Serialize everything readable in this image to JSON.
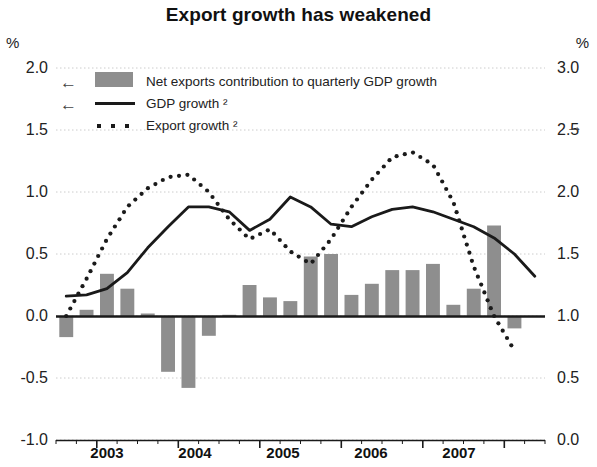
{
  "title": "Export growth has weakened",
  "axis": {
    "left_unit": "%",
    "right_unit": "%",
    "left_ticks": [
      "2.0",
      "1.5",
      "1.0",
      "0.5",
      "0.0",
      "-0.5",
      "-1.0"
    ],
    "right_ticks": [
      "3.0",
      "2.5",
      "2.0",
      "1.5",
      "1.0",
      "0.5",
      "0.0"
    ],
    "x_ticks": [
      "2003",
      "2004",
      "2005",
      "2006",
      "2007"
    ]
  },
  "legend": {
    "bars": "Net exports contribution to quarterly GDP growth",
    "gdp": "GDP growth ²",
    "exports": "Export growth ²",
    "arrow_left": "←",
    "arrow_right": "→"
  },
  "colors": {
    "bar": "#8e8e8e",
    "line": "#1a1a1a",
    "grid": "#cccccc",
    "axis": "#1a1a1a",
    "text": "#1a1a1a"
  },
  "chart_data": {
    "type": "bar",
    "title": "Export growth has weakened",
    "xlabel": "",
    "ylabel": "%",
    "ylim": [
      -1.0,
      2.0
    ],
    "y2lim": [
      0.0,
      3.0
    ],
    "grid": true,
    "legend_position": "top-left",
    "categories": [
      "2002 Q3",
      "2002 Q4",
      "2003 Q1",
      "2003 Q2",
      "2003 Q3",
      "2003 Q4",
      "2004 Q1",
      "2004 Q2",
      "2004 Q3",
      "2004 Q4",
      "2005 Q1",
      "2005 Q2",
      "2005 Q3",
      "2005 Q4",
      "2006 Q1",
      "2006 Q2",
      "2006 Q3",
      "2006 Q4",
      "2007 Q1",
      "2007 Q2",
      "2007 Q3",
      "2007 Q4",
      "2008 Q1",
      "2008 Q2"
    ],
    "series": [
      {
        "name": "Net exports contribution to quarterly GDP growth",
        "type": "bar",
        "axis": "left",
        "values": [
          -0.17,
          0.05,
          0.34,
          0.22,
          0.02,
          -0.45,
          -0.58,
          -0.16,
          0.01,
          0.25,
          0.15,
          0.12,
          0.48,
          0.5,
          0.17,
          0.26,
          0.37,
          0.37,
          0.42,
          0.09,
          0.22,
          0.73,
          -0.1,
          null
        ]
      },
      {
        "name": "GDP growth ²",
        "type": "line",
        "axis": "left",
        "values": [
          0.16,
          0.17,
          0.22,
          0.35,
          0.55,
          0.72,
          0.88,
          0.88,
          0.84,
          0.69,
          0.78,
          0.96,
          0.88,
          0.74,
          0.72,
          0.8,
          0.86,
          0.88,
          0.84,
          0.78,
          0.72,
          0.63,
          0.5,
          0.32
        ]
      },
      {
        "name": "Export growth ²",
        "type": "line",
        "style": "dotted",
        "axis": "right",
        "values": [
          1.0,
          1.3,
          1.62,
          1.88,
          2.03,
          2.12,
          2.14,
          2.0,
          1.78,
          1.62,
          1.7,
          1.52,
          1.42,
          1.62,
          1.88,
          2.1,
          2.28,
          2.32,
          2.22,
          1.92,
          1.4,
          1.0,
          0.72,
          null
        ]
      }
    ]
  }
}
